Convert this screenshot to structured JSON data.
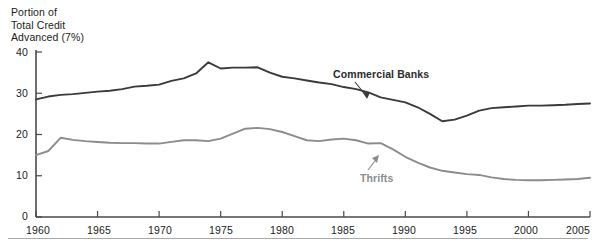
{
  "chart_data": {
    "type": "line",
    "title": "",
    "ylabel": "Portion of\nTotal Credit\nAdvanced (7%)",
    "xlabel": "",
    "xlim": [
      1960,
      2005
    ],
    "ylim": [
      0,
      40
    ],
    "grid": false,
    "legend_position": "inline-annotations",
    "xticks": [
      1960,
      1965,
      1970,
      1975,
      1980,
      1985,
      1990,
      1995,
      2000,
      2005
    ],
    "yticks": [
      0,
      10,
      20,
      30,
      40
    ],
    "x": [
      1960,
      1961,
      1962,
      1963,
      1964,
      1965,
      1966,
      1967,
      1968,
      1969,
      1970,
      1971,
      1972,
      1973,
      1974,
      1975,
      1976,
      1977,
      1978,
      1979,
      1980,
      1981,
      1982,
      1983,
      1984,
      1985,
      1986,
      1987,
      1988,
      1989,
      1990,
      1991,
      1992,
      1993,
      1994,
      1995,
      1996,
      1997,
      1998,
      1999,
      2000,
      2001,
      2002,
      2003,
      2004,
      2005
    ],
    "series": [
      {
        "name": "Commercial Banks",
        "color": "#3a3a3a",
        "values": [
          28.5,
          29.2,
          29.6,
          29.8,
          30.1,
          30.4,
          30.6,
          31.0,
          31.6,
          31.8,
          32.1,
          33.0,
          33.6,
          34.8,
          37.5,
          36.0,
          36.2,
          36.2,
          36.3,
          35.0,
          34.0,
          33.6,
          33.1,
          32.6,
          32.2,
          31.5,
          31.0,
          30.2,
          29.0,
          28.4,
          27.8,
          26.6,
          25.0,
          23.2,
          23.6,
          24.6,
          25.8,
          26.4,
          26.6,
          26.8,
          27.0,
          27.0,
          27.1,
          27.2,
          27.4,
          27.5
        ]
      },
      {
        "name": "Thrifts",
        "color": "#8c8c8c",
        "values": [
          15.0,
          16.0,
          19.2,
          18.7,
          18.4,
          18.2,
          18.0,
          17.9,
          17.9,
          17.8,
          17.8,
          18.2,
          18.6,
          18.6,
          18.4,
          19.0,
          20.2,
          21.4,
          21.6,
          21.3,
          20.6,
          19.6,
          18.6,
          18.4,
          18.8,
          19.0,
          18.6,
          17.8,
          17.9,
          16.4,
          14.6,
          13.2,
          12.0,
          11.2,
          10.8,
          10.4,
          10.2,
          9.6,
          9.2,
          9.0,
          8.9,
          8.9,
          9.0,
          9.1,
          9.2,
          9.5
        ]
      }
    ],
    "annotations": [
      {
        "text": "Commercial Banks",
        "target_year": 1989,
        "target_value": 28.6
      },
      {
        "text": "Thrifts",
        "target_value": 17.9,
        "target_year": 1988
      }
    ]
  },
  "axis": {
    "caption": "Portion of\nTotal Credit\nAdvanced (7%)",
    "y_ticks": [
      "40",
      "30",
      "20",
      "10",
      "0"
    ],
    "x_ticks": [
      "1960",
      "1965",
      "1970",
      "1975",
      "1980",
      "1985",
      "1990",
      "1995",
      "2000",
      "2005"
    ]
  },
  "labels": {
    "commercial_banks": "Commercial Banks",
    "thrifts": "Thrifts"
  }
}
